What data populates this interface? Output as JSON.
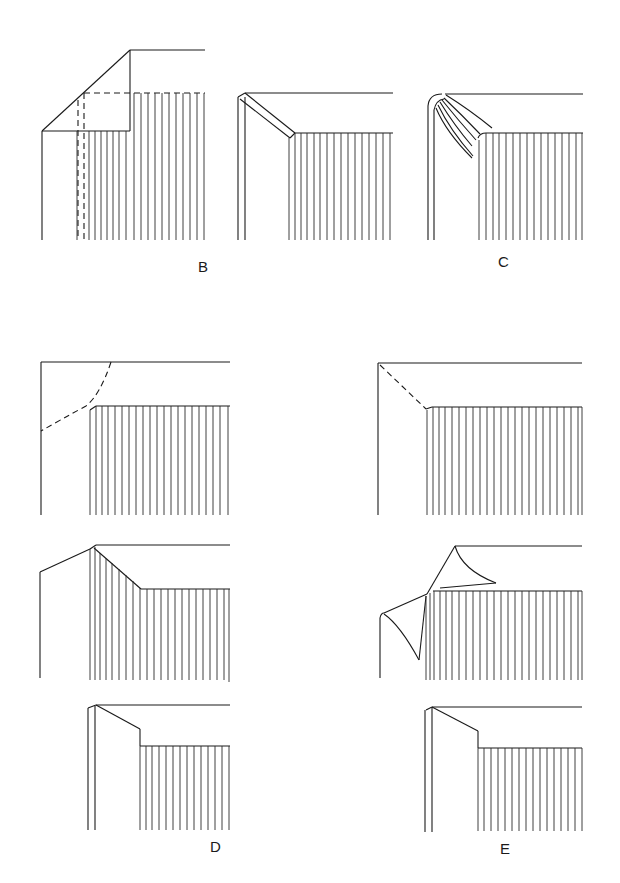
{
  "diagram": {
    "stroke_color": "#1a1a1a",
    "background": "#ffffff",
    "figures": [
      {
        "id": "B-left",
        "label": "",
        "description": "Corner with diagonal cut, dashed fold lines"
      },
      {
        "id": "B-mid",
        "label": "B",
        "description": "Diagonal fold turned in over board"
      },
      {
        "id": "C",
        "label": "C",
        "description": "Rounded corner with pleated turn-in"
      },
      {
        "id": "D-top",
        "label": "",
        "description": "Corner with dashed curved cut line"
      },
      {
        "id": "E-top",
        "label": "",
        "description": "Corner with dashed diagonal cut line"
      },
      {
        "id": "D-mid",
        "label": "",
        "description": "Angled fold over spine hatching"
      },
      {
        "id": "E-mid",
        "label": "",
        "description": "Curled corner turn-in"
      },
      {
        "id": "D-bot",
        "label": "D",
        "description": "Finished stepped corner"
      },
      {
        "id": "E-bot",
        "label": "E",
        "description": "Finished stepped corner"
      }
    ],
    "labels": {
      "B": "B",
      "C": "C",
      "D": "D",
      "E": "E"
    }
  }
}
